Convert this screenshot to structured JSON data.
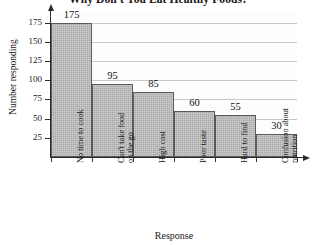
{
  "chart_data": {
    "type": "bar",
    "title": "Why Don't You Eat Healthy Foods?",
    "xlabel": "Response",
    "ylabel": "Number responding",
    "categories": [
      "No time to cook",
      "Can't take food\non the go",
      "High cost",
      "Poor taste",
      "Hard to find",
      "Confusion about\nnutrition"
    ],
    "values": [
      175,
      95,
      85,
      60,
      55,
      30
    ],
    "ylim": [
      0,
      187.5
    ],
    "yticks": [
      25,
      50,
      75,
      100,
      125,
      150,
      175
    ],
    "ytick_labels": [
      "25",
      "50",
      "75",
      "100",
      "125",
      "150",
      "175"
    ],
    "value_labels": [
      "175",
      "95",
      "85",
      "60",
      "55",
      "30"
    ],
    "grid": true,
    "legend": null,
    "bar_color": "#a9a9a9",
    "bar_border_color": "#5a5a5a",
    "gridline_color": "#c9c9c9",
    "axis_color": "#2b2b2b",
    "background_color": "#ffffff"
  }
}
